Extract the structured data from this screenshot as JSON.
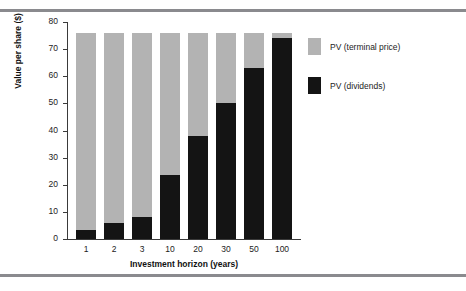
{
  "chart_data": {
    "type": "bar",
    "stacked": true,
    "title": "",
    "xlabel": "Investment horizon (years)",
    "ylabel": "Value per share ($)",
    "categories": [
      "1",
      "2",
      "3",
      "10",
      "20",
      "30",
      "50",
      "100"
    ],
    "series": [
      {
        "name": "PV (dividends)",
        "color": "#141414",
        "values": [
          3.5,
          5.8,
          8.0,
          23.5,
          38.0,
          50.0,
          63.0,
          74.0
        ]
      },
      {
        "name": "PV (terminal price)",
        "color": "#b3b3b3",
        "values": [
          72.5,
          70.2,
          68.0,
          52.5,
          38.0,
          26.0,
          13.0,
          2.0
        ]
      }
    ],
    "totals": [
      76,
      76,
      76,
      76,
      76,
      76,
      76,
      76
    ],
    "ylim": [
      0,
      80
    ],
    "yticks": [
      0,
      10,
      20,
      30,
      40,
      50,
      60,
      70,
      80
    ],
    "ytick_labels": [
      "0",
      "10",
      "20",
      "30",
      "40",
      "50",
      "60",
      "70",
      "80"
    ],
    "grid": false,
    "legend_position": "right",
    "legend": [
      {
        "label": "PV (terminal price)",
        "color": "#b3b3b3"
      },
      {
        "label": "PV (dividends)",
        "color": "#141414"
      }
    ]
  },
  "decor": {
    "rule_color": "#8a8a8e"
  }
}
